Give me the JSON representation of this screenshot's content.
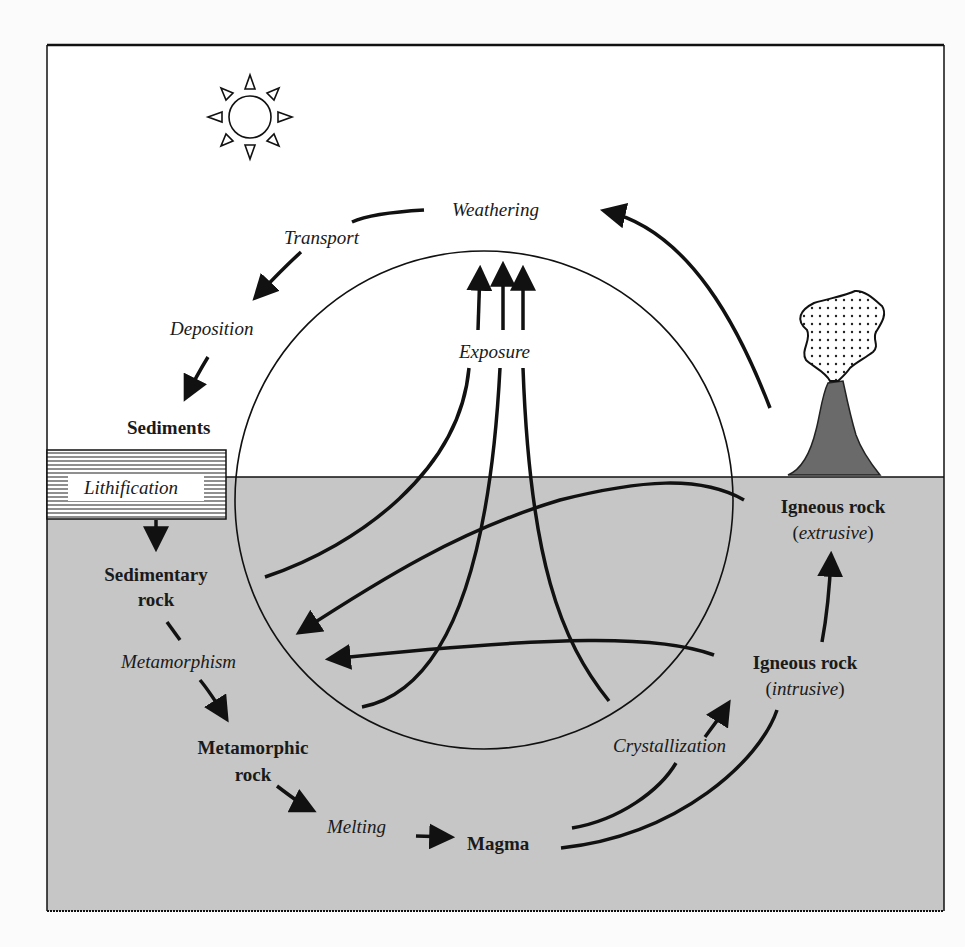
{
  "diagram": {
    "colors": {
      "sky": "#ffffff",
      "ground": "#c6c6c6",
      "ink": "#111111",
      "volcano": "#6a6a6a",
      "page": "#fbfbfb"
    },
    "icons": {
      "sun": "sun-icon",
      "volcano": "volcano-icon",
      "ash_cloud": "ash-cloud-icon"
    },
    "processes": {
      "weathering": "Weathering",
      "transport": "Transport",
      "deposition": "Deposition",
      "lithification": "Lithification",
      "exposure": "Exposure",
      "metamorphism": "Metamorphism",
      "melting": "Melting",
      "crystallization": "Crystallization"
    },
    "materials": {
      "sediments": "Sediments",
      "sedimentary_line1": "Sedimentary",
      "sedimentary_line2": "rock",
      "metamorphic_line1": "Metamorphic",
      "metamorphic_line2": "rock",
      "magma": "Magma",
      "igneous_extrusive_title": "Igneous rock",
      "igneous_extrusive_sub": "extrusive",
      "igneous_intrusive_title": "Igneous rock",
      "igneous_intrusive_sub": "intrusive",
      "paren_open": "(",
      "paren_close": ")"
    }
  }
}
